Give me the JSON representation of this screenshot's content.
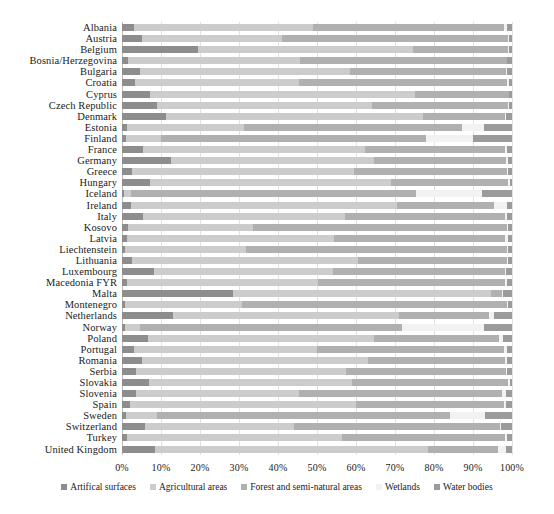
{
  "chart_data": {
    "type": "bar",
    "orientation": "horizontal",
    "stacked": true,
    "title": "",
    "subtitle": "",
    "xlabel": "",
    "ylabel": "",
    "xlim": [
      0,
      100
    ],
    "xticks": [
      "0%",
      "10%",
      "20%",
      "30%",
      "40%",
      "50%",
      "60%",
      "70%",
      "80%",
      "90%",
      "100%"
    ],
    "grid": true,
    "legend_position": "bottom",
    "units": "percent",
    "series": [
      {
        "name": "Artifical surfaces",
        "color": "#8d8d8d",
        "values": [
          3.0,
          5.0,
          19.5,
          1.6,
          4.5,
          3.3,
          7.2,
          9.0,
          11.2,
          1.3,
          1.0,
          5.3,
          12.5,
          2.6,
          7.1,
          0.4,
          2.4,
          5.3,
          1.6,
          1.3,
          0.7,
          2.6,
          8.2,
          1.3,
          28.5,
          0.8,
          13.0,
          0.7,
          6.6,
          3.0,
          5.1,
          3.5,
          7.0,
          3.5,
          2.0,
          1.1,
          6.0,
          1.3,
          8.5
        ]
      },
      {
        "name": "Agricultural areas",
        "color": "#cccccc",
        "values": [
          46.0,
          36.0,
          55.0,
          44.0,
          54.0,
          42.0,
          68.0,
          55.0,
          66.0,
          30.0,
          9.0,
          57.0,
          52.0,
          57.0,
          62.0,
          2.0,
          68.0,
          52.0,
          32.0,
          53.0,
          31.0,
          58.0,
          46.0,
          49.0,
          66.0,
          30.0,
          58.0,
          4.0,
          58.0,
          47.0,
          58.0,
          54.0,
          52.0,
          42.0,
          58.0,
          8.0,
          38.0,
          55.0,
          70.0
        ]
      },
      {
        "name": "Forest and semi-natural areas",
        "color": "#b0b0b0",
        "values": [
          49.0,
          58.0,
          24.5,
          53.0,
          40.0,
          53.5,
          24.0,
          35.0,
          21.0,
          56.0,
          68.0,
          36.0,
          34.0,
          39.0,
          30.0,
          73.0,
          25.0,
          41.0,
          65.0,
          44.0,
          67.0,
          38.0,
          44.0,
          48.0,
          3.0,
          68.0,
          23.0,
          67.0,
          32.0,
          48.0,
          35.0,
          41.0,
          40.0,
          52.0,
          38.0,
          75.0,
          53.0,
          42.0,
          18.0
        ]
      },
      {
        "name": "Wetlands",
        "color": "#f2f2f2",
        "values": [
          0.6,
          0.2,
          0.3,
          0.1,
          0.3,
          0.5,
          0.1,
          0.3,
          0.3,
          5.5,
          12.0,
          0.4,
          0.6,
          0.3,
          0.3,
          17.0,
          3.2,
          0.3,
          0.3,
          0.8,
          0.4,
          0.3,
          0.3,
          0.4,
          0.2,
          0.3,
          1.5,
          21.0,
          1.0,
          0.6,
          0.7,
          0.3,
          0.4,
          1.0,
          0.4,
          9.0,
          0.3,
          0.3,
          2.0
        ]
      },
      {
        "name": "Water bodies",
        "color": "#9b9b9b",
        "values": [
          1.4,
          0.8,
          0.7,
          1.3,
          1.2,
          0.7,
          0.7,
          0.7,
          1.5,
          7.2,
          10.0,
          1.3,
          0.9,
          1.1,
          0.6,
          7.6,
          1.4,
          1.4,
          1.1,
          0.9,
          0.9,
          1.1,
          1.5,
          1.3,
          2.3,
          0.9,
          4.5,
          7.3,
          2.4,
          1.4,
          1.2,
          1.2,
          0.6,
          1.5,
          1.6,
          6.9,
          2.7,
          1.4,
          1.5
        ]
      }
    ],
    "categories": [
      "Albania",
      "Austria",
      "Belgium",
      "Bosnia/Herzegovina",
      "Bulgaria",
      "Croatia",
      "Cyprus",
      "Czech Republic",
      "Denmark",
      "Estonia",
      "Finland",
      "France",
      "Germany",
      "Greece",
      "Hungary",
      "Iceland",
      "Ireland",
      "Italy",
      "Kosovo",
      "Latvia",
      "Liechtenstein",
      "Lithuania",
      "Luxembourg",
      "Macedonia FYR",
      "Malta",
      "Montenegro",
      "Netherlands",
      "Norway",
      "Poland",
      "Portugal",
      "Romania",
      "Serbia",
      "Slovakia",
      "Slovenia",
      "Spain",
      "Sweden",
      "Switzerland",
      "Turkey",
      "United Kingdom"
    ]
  }
}
